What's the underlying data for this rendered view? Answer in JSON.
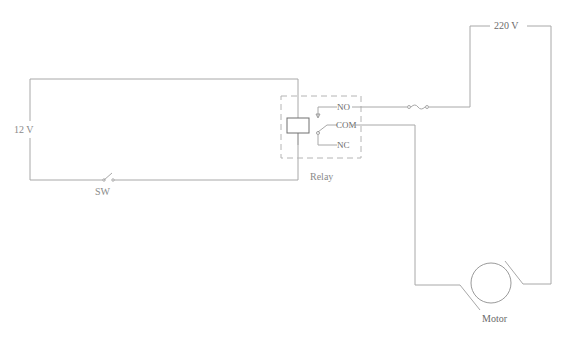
{
  "diagram": {
    "type": "relay-motor-circuit",
    "labels": {
      "control_voltage": "12 V",
      "switch": "SW",
      "relay": "Relay",
      "relay_no": "NO",
      "relay_com": "COM",
      "relay_nc": "NC",
      "supply_voltage": "220 V",
      "motor": "Motor"
    },
    "components": [
      {
        "id": "source-12v",
        "label": "12 V"
      },
      {
        "id": "switch-sw",
        "label": "SW"
      },
      {
        "id": "relay",
        "label": "Relay",
        "terminals": [
          "NO",
          "COM",
          "NC"
        ]
      },
      {
        "id": "fuse",
        "label": ""
      },
      {
        "id": "source-220v",
        "label": "220 V"
      },
      {
        "id": "motor",
        "label": "Motor"
      }
    ],
    "colors": {
      "wire": "#a8a8a8",
      "text": "#8a8a8a"
    }
  }
}
